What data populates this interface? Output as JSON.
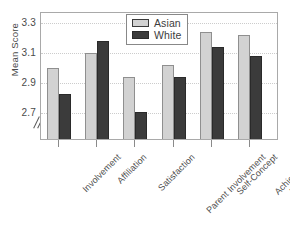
{
  "chart_data": {
    "type": "bar",
    "title": "",
    "xlabel": "",
    "ylabel": "Mean Score",
    "ylim": [
      2.6,
      3.36
    ],
    "y_axis_break": true,
    "y_axis_break_symbol": "//",
    "yticks": [
      "3.3",
      "3.1",
      "2.9",
      "2.7"
    ],
    "ytick_values": [
      3.3,
      3.1,
      2.9,
      2.7
    ],
    "grid": true,
    "grid_style": "dotted",
    "legend_position": "top-center",
    "categories": [
      "Involvement",
      "Affiliation",
      "Satisfaction",
      "Parent Involvement",
      "Self-Concept",
      "Achievement\nMotivation"
    ],
    "series": [
      {
        "name": "Asian",
        "color": "#d2d2d2",
        "values": [
          3.0,
          3.1,
          2.94,
          3.02,
          3.24,
          3.22
        ]
      },
      {
        "name": "White",
        "color": "#3b3b3b",
        "values": [
          2.83,
          3.18,
          2.71,
          2.94,
          3.14,
          3.08
        ]
      }
    ]
  },
  "legend": {
    "items": [
      {
        "label": "Asian"
      },
      {
        "label": "White"
      }
    ]
  },
  "xlabels": [
    {
      "line1": "Involvement",
      "line2": ""
    },
    {
      "line1": "Affiliation",
      "line2": ""
    },
    {
      "line1": "Satisfaction",
      "line2": ""
    },
    {
      "line1": "Parent Involvement",
      "line2": ""
    },
    {
      "line1": "Self-Concept",
      "line2": ""
    },
    {
      "line1": "Achievement",
      "line2": "Motivation"
    }
  ]
}
